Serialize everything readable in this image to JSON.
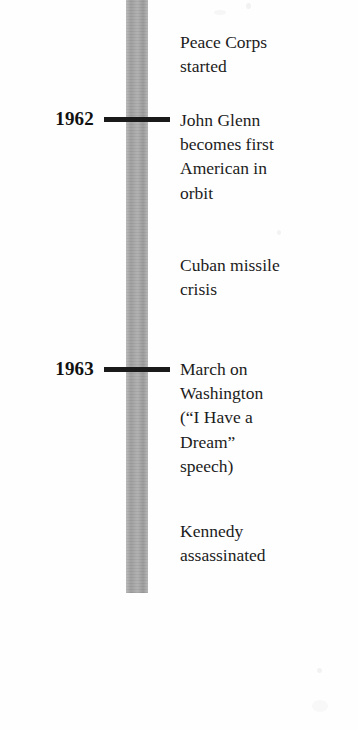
{
  "document": {
    "type": "textbook-timeline",
    "subject": "Kennedy administration events 1961-1963",
    "bar_color": "#a6a6a6",
    "tick_color": "#1a1a1a",
    "text_color": "#1c1c1c",
    "background_color": "#ffffff"
  },
  "years": [
    {
      "label": "1962",
      "tick_y": 117
    },
    {
      "label": "1963",
      "tick_y": 367
    }
  ],
  "events": [
    {
      "id": "peace-corps",
      "lines": [
        "Peace Corps",
        "started"
      ]
    },
    {
      "id": "john-glenn",
      "lines": [
        "John Glenn",
        "becomes first",
        "American in",
        "orbit"
      ]
    },
    {
      "id": "cuban-missile-crisis",
      "lines": [
        "Cuban missile",
        "crisis"
      ]
    },
    {
      "id": "march-on-washington",
      "lines": [
        "March on",
        "Washington",
        "(“I Have a",
        "Dream”",
        "speech)"
      ]
    },
    {
      "id": "kennedy-assassinated",
      "lines": [
        "Kennedy",
        "assassinated"
      ]
    }
  ]
}
